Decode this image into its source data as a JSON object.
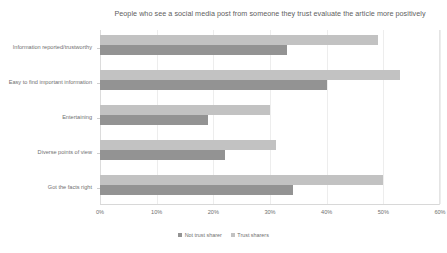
{
  "chart_data": {
    "type": "bar",
    "orientation": "horizontal",
    "title": "People who see a social media post from someone they trust evaluate the article more positively",
    "xlabel": "",
    "ylabel": "",
    "xlim": [
      0,
      60
    ],
    "xticks": [
      "0%",
      "10%",
      "20%",
      "30%",
      "40%",
      "50%",
      "60%"
    ],
    "xtick_values": [
      0,
      10,
      20,
      30,
      40,
      50,
      60
    ],
    "grid": true,
    "legend_position": "bottom",
    "categories": [
      "Information reported/trustworthy",
      "Easy to find important information",
      "Entertaining",
      "Diverse points of view",
      "Got the facts right"
    ],
    "series": [
      {
        "name": "Not trust sharer",
        "color": "#939393",
        "values": [
          33,
          40,
          19,
          22,
          34
        ]
      },
      {
        "name": "Trust sharers",
        "color": "#c2c2c2",
        "values": [
          49,
          53,
          30,
          31,
          50
        ]
      }
    ]
  },
  "legend": {
    "items": [
      {
        "label": "Not trust sharer",
        "color": "#939393"
      },
      {
        "label": "Trust sharers",
        "color": "#c2c2c2"
      }
    ]
  }
}
